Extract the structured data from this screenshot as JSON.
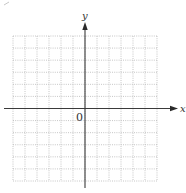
{
  "diagram": {
    "type": "coordinate-grid",
    "axes": {
      "x_label": "x",
      "y_label": "y",
      "origin_label": "0"
    },
    "grid": {
      "columns": 12,
      "rows": 12,
      "line_style": "dotted",
      "line_color": "#b8b8b8"
    },
    "colors": {
      "axis": "#3a3a3a",
      "background": "#ffffff",
      "text": "#333333"
    }
  }
}
